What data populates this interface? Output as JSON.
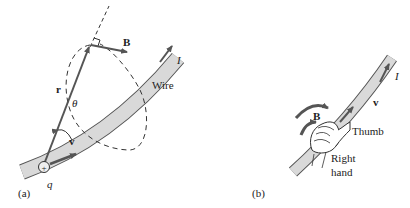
{
  "panels": {
    "a": {
      "caption": "(a)",
      "labels": {
        "B": "B",
        "I": "I",
        "wire": "Wire",
        "r": "r",
        "theta": "θ",
        "v": "v",
        "q": "q",
        "charge": "+"
      }
    },
    "b": {
      "caption": "(b)",
      "labels": {
        "B": "B",
        "I": "I",
        "v": "v",
        "thumb": "Thumb",
        "right": "Right",
        "hand": "hand"
      }
    }
  },
  "colors": {
    "wire_fill": "#d9d9d9",
    "wire_edge": "#555555",
    "arrow": "#555555",
    "text": "#222222"
  }
}
